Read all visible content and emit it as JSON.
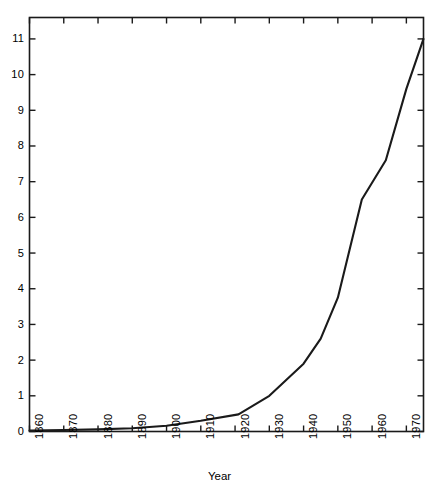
{
  "figure": {
    "background_color": "#ffffff",
    "line_color": "#1a1a1a",
    "axis_color": "#1a1a1a"
  },
  "axes": {
    "x_title": "Year",
    "y_title": "",
    "x_ticks": [
      "1860",
      "1870",
      "1880",
      "1890",
      "1900",
      "1910",
      "1920",
      "1930",
      "1940",
      "1950",
      "1960",
      "1970"
    ],
    "y_ticks": [
      "0",
      "1",
      "2",
      "3",
      "4",
      "5",
      "6",
      "7",
      "8",
      "9",
      "10",
      "11"
    ]
  },
  "chart_data": {
    "type": "line",
    "title": "",
    "xlabel": "Year",
    "ylabel": "",
    "xlim": [
      1860,
      1975
    ],
    "ylim": [
      0,
      11.6
    ],
    "grid": false,
    "legend": "none",
    "x_tick_values": [
      1860,
      1870,
      1880,
      1890,
      1900,
      1910,
      1920,
      1930,
      1940,
      1950,
      1960,
      1970
    ],
    "y_tick_values": [
      0,
      1,
      2,
      3,
      4,
      5,
      6,
      7,
      8,
      9,
      10,
      11
    ],
    "x_tick_rotation": 90,
    "series": [
      {
        "name": "value",
        "x": [
          1860,
          1870,
          1880,
          1890,
          1900,
          1910,
          1921,
          1930,
          1940,
          1945,
          1950,
          1957,
          1964,
          1970,
          1975
        ],
        "values": [
          0.03,
          0.04,
          0.06,
          0.09,
          0.16,
          0.3,
          0.48,
          1.0,
          1.9,
          2.6,
          3.75,
          6.5,
          7.6,
          9.6,
          11.0
        ]
      }
    ]
  }
}
